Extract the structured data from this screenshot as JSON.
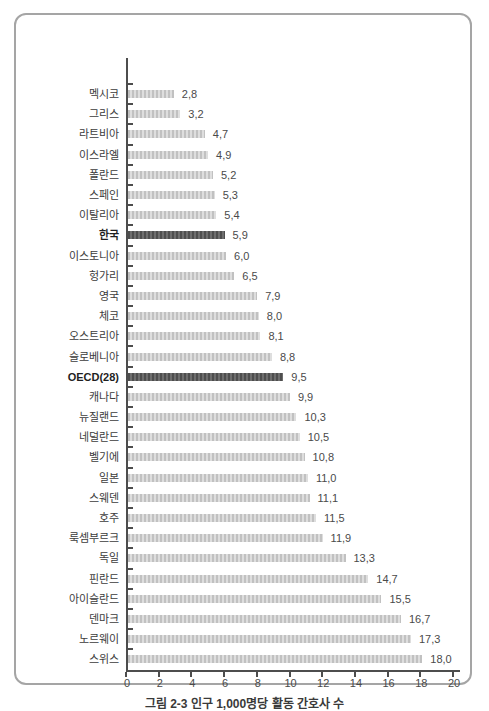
{
  "figure": {
    "caption": "그림 2-3  인구 1,000명당 활동 간호사 수"
  },
  "chart_data": {
    "type": "bar",
    "orientation": "horizontal",
    "title": "",
    "xlabel": "",
    "ylabel": "",
    "xlim": [
      0,
      20
    ],
    "x_tick_labels": [
      "0",
      "2",
      "4",
      "6",
      "8",
      "10",
      "12",
      "14",
      "16",
      "18",
      "20"
    ],
    "grid": false,
    "legend": "none",
    "value_label_decimal_separator": ",",
    "categories": [
      "멕시코",
      "그리스",
      "라트비아",
      "이스라엘",
      "폴란드",
      "스페인",
      "이탈리아",
      "한국",
      "이스토니아",
      "헝가리",
      "영국",
      "체코",
      "오스트리아",
      "슬로베니아",
      "OECD(28)",
      "캐나다",
      "뉴질랜드",
      "네덜란드",
      "벨기에",
      "일본",
      "스웨덴",
      "호주",
      "룩셈부르크",
      "독일",
      "핀란드",
      "아이슬란드",
      "덴마크",
      "노르웨이",
      "스위스"
    ],
    "values": [
      2.8,
      3.2,
      4.7,
      4.9,
      5.2,
      5.3,
      5.4,
      5.9,
      6.0,
      6.5,
      7.9,
      8.0,
      8.1,
      8.8,
      9.5,
      9.9,
      10.3,
      10.5,
      10.8,
      11.0,
      11.1,
      11.5,
      11.9,
      13.3,
      14.7,
      15.5,
      16.7,
      17.3,
      18.0
    ],
    "value_labels": [
      "2,8",
      "3,2",
      "4,7",
      "4,9",
      "5,2",
      "5,3",
      "5,4",
      "5,9",
      "6,0",
      "6,5",
      "7,9",
      "8,0",
      "8,1",
      "8,8",
      "9,5",
      "9,9",
      "10,3",
      "10,5",
      "10,8",
      "11,0",
      "11,1",
      "11,5",
      "11,9",
      "13,3",
      "14,7",
      "15,5",
      "16,7",
      "17,3",
      "18,0"
    ],
    "emphasized_categories": [
      "한국",
      "OECD(28)"
    ],
    "colors": {
      "bar": "#c1c1c1",
      "bar_stripe": "#dedede",
      "emphasis_bar": "#4e4e4e",
      "emphasis_bar_stripe": "#6e6e6e",
      "axis": "#4d4d4d",
      "category_label": "#3c3c3c",
      "value_label": "#4a4a4a",
      "frame_border": "#a5a5a5",
      "background": "#ffffff"
    }
  }
}
